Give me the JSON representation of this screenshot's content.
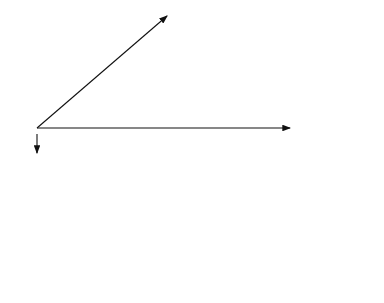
{
  "top_grid": {
    "axes": {
      "x": "x",
      "y": "y",
      "z": "z"
    },
    "nodes": [
      {
        "id": "1",
        "label": "1",
        "row": 0,
        "col": 0,
        "support": true
      },
      {
        "id": "2",
        "label": "2",
        "row": 0,
        "col": 1,
        "support": true
      },
      {
        "id": "3",
        "label": "3",
        "row": 0,
        "col": 2,
        "support": true
      },
      {
        "id": "4",
        "label": "4",
        "row": 0,
        "col": 3,
        "support": true
      },
      {
        "id": "5",
        "label": "5",
        "row": 0,
        "col": 4,
        "support": true
      },
      {
        "id": "6",
        "label": "6",
        "row": 1,
        "col": 0,
        "support": true
      },
      {
        "id": "7",
        "label": "7",
        "row": 1,
        "col": 1,
        "cross": true
      },
      {
        "id": "8",
        "label": "8",
        "row": 1,
        "col": 2
      },
      {
        "id": "9",
        "label": "9",
        "row": 1,
        "col": 3,
        "cross": true
      },
      {
        "id": "10",
        "label": "10",
        "row": 1,
        "col": 4,
        "support": true
      },
      {
        "id": "11",
        "label": "11",
        "row": 2,
        "col": 0,
        "support": true
      },
      {
        "id": "12",
        "label": "12",
        "row": 2,
        "col": 1
      },
      {
        "id": "13",
        "label": "13",
        "row": 2,
        "col": 2
      },
      {
        "id": "14",
        "label": "14",
        "row": 2,
        "col": 3
      },
      {
        "id": "15",
        "label": "15",
        "row": 2,
        "col": 4,
        "support": true
      },
      {
        "id": "16",
        "label": "16",
        "row": 3,
        "col": 0,
        "support": true
      },
      {
        "id": "17",
        "label": "17",
        "row": 3,
        "col": 1,
        "cross": true
      },
      {
        "id": "18",
        "label": "18",
        "row": 3,
        "col": 2
      },
      {
        "id": "19",
        "label": "19",
        "row": 3,
        "col": 3,
        "cross": true
      },
      {
        "id": "20",
        "label": "20",
        "row": 3,
        "col": 4,
        "support": true
      },
      {
        "id": "21",
        "label": "21",
        "row": 4,
        "col": 0,
        "support": true
      },
      {
        "id": "22",
        "label": "22",
        "row": 4,
        "col": 1,
        "support": true
      },
      {
        "id": "23",
        "label": "23",
        "row": 4,
        "col": 2,
        "support": true
      },
      {
        "id": "24",
        "label": "24",
        "row": 4,
        "col": 3,
        "support": true
      },
      {
        "id": "25",
        "label": "25",
        "row": 4,
        "col": 4,
        "support": true
      }
    ]
  },
  "bottom_grid": {
    "labels": [
      {
        "text": "10",
        "x": 128,
        "y": 185
      },
      {
        "text": "11",
        "x": 181,
        "y": 185
      },
      {
        "text": "12",
        "x": 235,
        "y": 185
      },
      {
        "text": "13",
        "x": 288,
        "y": 185
      },
      {
        "text": "14",
        "x": 341,
        "y": 185
      },
      {
        "text": "15",
        "x": 101,
        "y": 210
      },
      {
        "text": "1",
        "x": 158,
        "y": 208
      },
      {
        "text": "5",
        "x": 210,
        "y": 208
      },
      {
        "text": "2",
        "x": 261,
        "y": 208
      },
      {
        "text": "16",
        "x": 315,
        "y": 210
      },
      {
        "text": "17",
        "x": 72,
        "y": 234
      },
      {
        "text": "6",
        "x": 130,
        "y": 232
      },
      {
        "text": "7",
        "x": 180,
        "y": 232
      },
      {
        "text": "8",
        "x": 232,
        "y": 232
      },
      {
        "text": "18",
        "x": 286,
        "y": 234
      },
      {
        "text": "19",
        "x": 44,
        "y": 256
      },
      {
        "text": "3",
        "x": 103,
        "y": 254
      },
      {
        "text": "9",
        "x": 155,
        "y": 254
      },
      {
        "text": "4",
        "x": 208,
        "y": 254
      },
      {
        "text": "20",
        "x": 259,
        "y": 256
      },
      {
        "text": "21",
        "x": 10,
        "y": 280
      },
      {
        "text": "22",
        "x": 65,
        "y": 280
      },
      {
        "text": "23",
        "x": 119,
        "y": 280
      },
      {
        "text": "24",
        "x": 172,
        "y": 280
      },
      {
        "text": "25",
        "x": 225,
        "y": 280
      }
    ]
  }
}
